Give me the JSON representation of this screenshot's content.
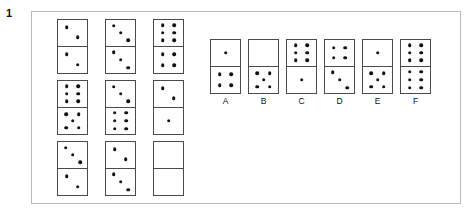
{
  "question": {
    "number": "1",
    "type": "domino-matrix-puzzle"
  },
  "matrix": {
    "rows": [
      [
        {
          "name": "matrix-domino-r1c1",
          "top": 2,
          "bottom": 2
        },
        {
          "name": "matrix-domino-r1c2",
          "top": 3,
          "bottom": 3
        },
        {
          "name": "matrix-domino-r1c3",
          "top": 6,
          "bottom": 4
        }
      ],
      [
        {
          "name": "matrix-domino-r2c1",
          "top": 6,
          "bottom": 5
        },
        {
          "name": "matrix-domino-r2c2",
          "top": 3,
          "bottom": 6
        },
        {
          "name": "matrix-domino-r2c3",
          "top": 2,
          "bottom": 1
        }
      ],
      [
        {
          "name": "matrix-domino-r3c1",
          "top": 3,
          "bottom": 2
        },
        {
          "name": "matrix-domino-r3c2",
          "top": 2,
          "bottom": 3
        },
        {
          "name": "matrix-domino-blank-answer",
          "top": 0,
          "bottom": 0
        }
      ]
    ]
  },
  "options": [
    {
      "label": "A",
      "top": 1,
      "bottom": 4
    },
    {
      "label": "B",
      "top": 0,
      "bottom": 5
    },
    {
      "label": "C",
      "top": 6,
      "bottom": 1
    },
    {
      "label": "D",
      "top": 4,
      "bottom": 3
    },
    {
      "label": "E",
      "top": 1,
      "bottom": 5
    },
    {
      "label": "F",
      "top": 6,
      "bottom": 6
    }
  ],
  "colors": {
    "pip": "#111111",
    "domino_border": "#4a4a4a",
    "panel_border": "#b9b9b9",
    "background": "#ffffff"
  }
}
